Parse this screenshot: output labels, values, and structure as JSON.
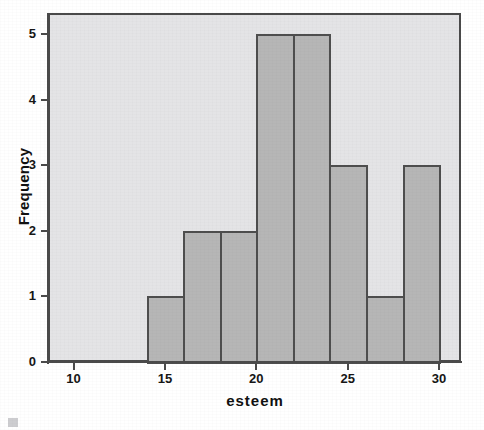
{
  "chart_data": {
    "type": "bar",
    "title": "",
    "subtitle": "",
    "xlabel": "esteem",
    "ylabel": "Frequency",
    "xlim": [
      8.6,
      31.2
    ],
    "ylim": [
      0,
      5.32
    ],
    "grid": false,
    "legend": null,
    "bin_width": 2,
    "bin_edges": [
      14,
      16,
      18,
      20,
      22,
      24,
      26,
      28,
      30
    ],
    "categories": [
      "14-16",
      "16-18",
      "18-20",
      "20-22",
      "22-24",
      "24-26",
      "26-28",
      "28-30"
    ],
    "values": [
      1,
      2,
      2,
      5,
      5,
      3,
      1,
      3
    ],
    "bin_centers": [
      15,
      17,
      19,
      21,
      23,
      25,
      27,
      29
    ],
    "xticks": [
      10,
      15,
      20,
      25,
      30
    ],
    "xtick_labels": [
      "10",
      "15",
      "20",
      "25",
      "30"
    ],
    "yticks": [
      0,
      1,
      2,
      3,
      4,
      5
    ],
    "ytick_labels": [
      "0",
      "1",
      "2",
      "3",
      "4",
      "5"
    ],
    "bar_fill_color": "#b6b6b6",
    "bar_edge_color": "#4e4e4e",
    "plot_background_color": "#e4e4e6",
    "axis_color": "#4a4a4a",
    "text_color": "#161616"
  },
  "axes": {
    "x_title": "esteem",
    "y_title": "Frequency"
  }
}
